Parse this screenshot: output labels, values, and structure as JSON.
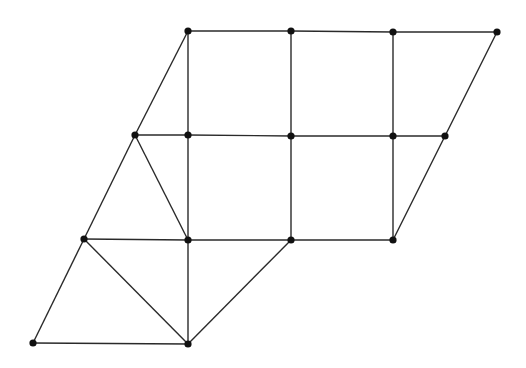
{
  "diagram": {
    "type": "planar-graph",
    "width": 526,
    "height": 368,
    "colors": {
      "edge": "#2a2a2a",
      "node": "#111111",
      "background": "#ffffff"
    },
    "nodes": [
      {
        "id": "a",
        "x": 188,
        "y": 31
      },
      {
        "id": "b",
        "x": 291,
        "y": 31
      },
      {
        "id": "c",
        "x": 393,
        "y": 32
      },
      {
        "id": "d",
        "x": 497,
        "y": 32
      },
      {
        "id": "e",
        "x": 135,
        "y": 135
      },
      {
        "id": "f",
        "x": 188,
        "y": 135
      },
      {
        "id": "g",
        "x": 291,
        "y": 136
      },
      {
        "id": "h",
        "x": 393,
        "y": 136
      },
      {
        "id": "i",
        "x": 445,
        "y": 136
      },
      {
        "id": "j",
        "x": 84,
        "y": 239
      },
      {
        "id": "k",
        "x": 188,
        "y": 240
      },
      {
        "id": "l",
        "x": 291,
        "y": 240
      },
      {
        "id": "m",
        "x": 393,
        "y": 240
      },
      {
        "id": "n",
        "x": 33,
        "y": 343
      },
      {
        "id": "o",
        "x": 188,
        "y": 344
      }
    ],
    "edges": [
      [
        "a",
        "b"
      ],
      [
        "b",
        "c"
      ],
      [
        "c",
        "d"
      ],
      [
        "a",
        "e"
      ],
      [
        "a",
        "f"
      ],
      [
        "b",
        "g"
      ],
      [
        "c",
        "h"
      ],
      [
        "d",
        "i"
      ],
      [
        "e",
        "f"
      ],
      [
        "f",
        "g"
      ],
      [
        "g",
        "h"
      ],
      [
        "h",
        "i"
      ],
      [
        "e",
        "j"
      ],
      [
        "e",
        "k"
      ],
      [
        "f",
        "k"
      ],
      [
        "g",
        "l"
      ],
      [
        "h",
        "m"
      ],
      [
        "i",
        "m"
      ],
      [
        "j",
        "k"
      ],
      [
        "k",
        "l"
      ],
      [
        "l",
        "m"
      ],
      [
        "j",
        "n"
      ],
      [
        "j",
        "o"
      ],
      [
        "k",
        "o"
      ],
      [
        "l",
        "o"
      ],
      [
        "n",
        "o"
      ]
    ]
  }
}
